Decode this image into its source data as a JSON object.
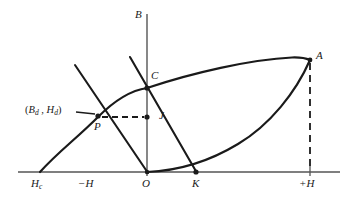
{
  "figure": {
    "type": "hysteresis-demagnetization-diagram",
    "title": "",
    "background_color": "#ffffff",
    "stroke_color": "#1a1a1a",
    "axis_color": "#4d4d4d",
    "labels": {
      "b_axis": "B",
      "point_a": "A",
      "point_c": "C",
      "point_j": "J",
      "point_p": "P",
      "point_k": "K",
      "point_o": "O",
      "coercivity": "H",
      "coercivity_sub": "c",
      "negative_h": "−H",
      "positive_h": "+H",
      "operating_point_open": "(",
      "operating_point_b": "B",
      "operating_point_b_sub": "d",
      "operating_point_comma": " , ",
      "operating_point_h": "H",
      "operating_point_h_sub": "d",
      "operating_point_close": ")"
    },
    "label_positions": {
      "b_axis": {
        "x": 137,
        "y": 11
      },
      "point_a": {
        "x": 316,
        "y": 53
      },
      "point_c": {
        "x": 151,
        "y": 73
      },
      "point_j": {
        "x": 160,
        "y": 112
      },
      "point_p": {
        "x": 95,
        "y": 122
      },
      "point_k": {
        "x": 191,
        "y": 178
      },
      "point_o": {
        "x": 141,
        "y": 178
      },
      "coercivity": {
        "x": 32,
        "y": 178
      },
      "negative_h": {
        "x": 79,
        "y": 178
      },
      "positive_h": {
        "x": 297,
        "y": 178
      },
      "operating_point": {
        "x": 26,
        "y": 110
      }
    },
    "geometry": {
      "origin": {
        "x": 147,
        "y": 172
      },
      "point_a": {
        "x": 310,
        "y": 60
      },
      "point_c": {
        "x": 147,
        "y": 88
      },
      "point_j": {
        "x": 147,
        "y": 117
      },
      "point_p": {
        "x": 98,
        "y": 117
      },
      "point_k": {
        "x": 196,
        "y": 172
      },
      "point_hc": {
        "x": 40,
        "y": 172
      },
      "h_axis": {
        "x1": 18,
        "y1": 172,
        "x2": 340,
        "y2": 172
      },
      "b_axis": {
        "x1": 147,
        "y1": 14,
        "x2": 147,
        "y2": 176
      },
      "tick_plus_h": {
        "x": 310,
        "y_top": 167,
        "y_bottom": 177
      },
      "dashed_vertical_a": {
        "x": 310,
        "y1": 62,
        "y2": 172
      },
      "dashed_horizontal_pj": {
        "x1": 103,
        "x2": 143,
        "y": 117
      },
      "leader_to_p": {
        "x1": 75,
        "x2": 94,
        "y": 111
      },
      "load_line": {
        "x1": 75,
        "y1": 65,
        "x2": 147,
        "y2": 172
      },
      "recoil_line": {
        "x1": 130,
        "y1": 57,
        "x2": 196,
        "y2": 172
      },
      "demag_curve": "M 40 172 C 60 150 78 138 98 117 C 118 96 134 90 147 88",
      "upper_branch": "M 147 88 C 190 74 250 60 292 58 C 301 57.5 306 58.5 310 60",
      "initial_curve": "M 147 172 C 175 170 207 163 240 143 C 272 124 296 90 310 60"
    },
    "markers": [
      {
        "name": "point-a-marker",
        "x": 310,
        "y": 60
      },
      {
        "name": "point-c-marker",
        "x": 147,
        "y": 88
      },
      {
        "name": "point-j-marker",
        "x": 147,
        "y": 117
      },
      {
        "name": "point-p-marker",
        "x": 98,
        "y": 117
      },
      {
        "name": "point-k-marker",
        "x": 196,
        "y": 172
      },
      {
        "name": "point-o-marker",
        "x": 147,
        "y": 172
      }
    ]
  }
}
